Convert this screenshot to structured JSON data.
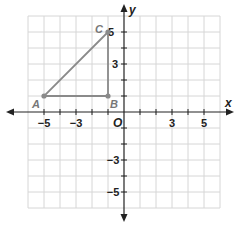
{
  "diagram": {
    "type": "coordinate-plane",
    "x_axis_label": "x",
    "y_axis_label": "y",
    "origin_label": "O",
    "x_range": [
      -6,
      6
    ],
    "y_range": [
      -6,
      6
    ],
    "x_tick_labels": [
      {
        "value": -5,
        "text": "−5"
      },
      {
        "value": -3,
        "text": "−3"
      },
      {
        "value": 3,
        "text": "3"
      },
      {
        "value": 5,
        "text": "5"
      }
    ],
    "y_tick_labels": [
      {
        "value": 5,
        "text": "5"
      },
      {
        "value": 3,
        "text": "3"
      },
      {
        "value": -3,
        "text": "−3"
      },
      {
        "value": -5,
        "text": "−5"
      }
    ],
    "points": [
      {
        "name": "A",
        "x": -5,
        "y": 1
      },
      {
        "name": "B",
        "x": -1,
        "y": 1
      },
      {
        "name": "C",
        "x": -1,
        "y": 5
      }
    ],
    "shape": "right triangle ABC",
    "colors": {
      "grid": "#d6d6d6",
      "axis": "#222222",
      "triangle": "#8a8a8a",
      "point_label": "#777777"
    }
  }
}
